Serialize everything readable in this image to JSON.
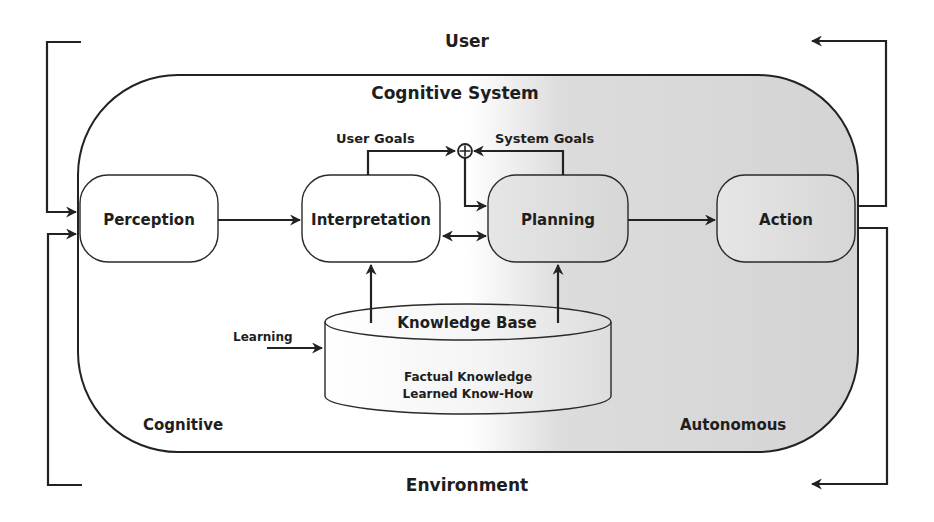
{
  "diagram": {
    "external": {
      "top_label": "User",
      "bottom_label": "Environment"
    },
    "system": {
      "title": "Cognitive System",
      "corner_left_label": "Cognitive",
      "corner_right_label": "Autonomous",
      "gradient_colors": [
        "#ffffff",
        "#d2d2d2"
      ]
    },
    "nodes": {
      "perception": "Perception",
      "interpretation": "Interpretation",
      "planning": "Planning",
      "action": "Action"
    },
    "goals": {
      "user_goals": "User Goals",
      "system_goals": "System Goals",
      "combine_symbol": "+"
    },
    "knowledge_base": {
      "title": "Knowledge Base",
      "line1": "Factual Knowledge",
      "line2": "Learned Know-How",
      "input_label": "Learning"
    }
  }
}
